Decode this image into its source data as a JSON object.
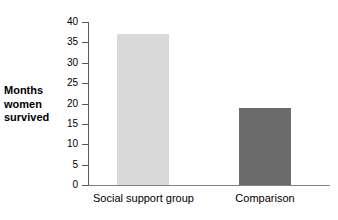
{
  "chart_data": {
    "type": "bar",
    "title": "",
    "subtitle": "",
    "xlabel": "",
    "ylabel": "Months women survived",
    "ylabel_lines": [
      "Months",
      "women",
      "survived"
    ],
    "categories": [
      "Social support group",
      "Comparison"
    ],
    "values": [
      37,
      19
    ],
    "series": [
      {
        "name": "Months women survived",
        "values": [
          37,
          19
        ]
      }
    ],
    "ylim": [
      0,
      40
    ],
    "ytick_step": 5,
    "yticks": [
      0,
      5,
      10,
      15,
      20,
      25,
      30,
      35,
      40
    ],
    "ytick_labels": [
      "0",
      "5",
      "10",
      "15",
      "20",
      "25",
      "30",
      "35",
      "40"
    ],
    "grid": false,
    "legend": false,
    "legend_position": "none",
    "bar_colors": [
      "#d9d9d9",
      "#6b6b6b"
    ],
    "axis_color": "#58595b",
    "text_color": "#000000",
    "background": "#ffffff"
  }
}
